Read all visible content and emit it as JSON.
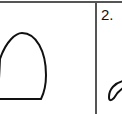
{
  "worksheet": {
    "cells": [
      {
        "shape": "dome-arch-outline"
      },
      {
        "number_label": "2.",
        "shape": "partial-curve-stroke"
      }
    ]
  },
  "colors": {
    "ink": "#111111",
    "border": "#555555",
    "paper": "#ffffff"
  }
}
